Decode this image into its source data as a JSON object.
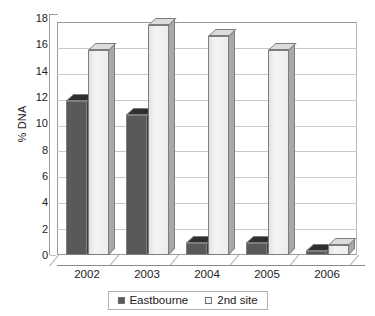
{
  "chart_data": {
    "type": "bar",
    "title": "",
    "subtitle": "",
    "xlabel": "",
    "ylabel": "% DNA",
    "categories": [
      "2002",
      "2003",
      "2004",
      "2005",
      "2006"
    ],
    "series": [
      {
        "name": "Eastbourne",
        "values": [
          11.9,
          10.8,
          0.9,
          0.9,
          0.3
        ],
        "color": "#595959",
        "swatch": "filled-square"
      },
      {
        "name": "2nd site",
        "values": [
          15.8,
          17.8,
          16.9,
          15.8,
          0.8
        ],
        "color": "#f1f1f1",
        "swatch": "open-square"
      }
    ],
    "ylim": [
      0,
      18
    ],
    "ytick_step": 2,
    "yticks": [
      "18",
      "16",
      "14",
      "12",
      "10",
      "8",
      "6",
      "4",
      "2",
      "0"
    ],
    "ytick_values": [
      18,
      16,
      14,
      12,
      10,
      8,
      6,
      4,
      2,
      0
    ],
    "grid": true,
    "grid_axis": "y",
    "legend_position": "bottom",
    "bar_style": "3d-column",
    "background_color": "#ffffff",
    "gridline_color": "#c9c9c9",
    "axis_color": "#8a8a8a"
  },
  "legend": {
    "entries": [
      {
        "label": "Eastbourne"
      },
      {
        "label": "2nd site"
      }
    ]
  }
}
